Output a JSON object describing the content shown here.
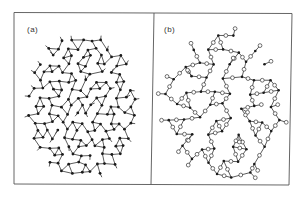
{
  "figure": {
    "panels": [
      {
        "id": "a",
        "label": "(a)",
        "description": "continuous random network, black nodes"
      },
      {
        "id": "b",
        "label": "(b)",
        "description": "network with black nodes bridged by open circles"
      }
    ],
    "colors": {
      "frame": "#555555",
      "bond": "#333333",
      "node_filled": "#1a1a1a",
      "node_open_fill": "#ffffff",
      "background": "#ffffff"
    }
  }
}
